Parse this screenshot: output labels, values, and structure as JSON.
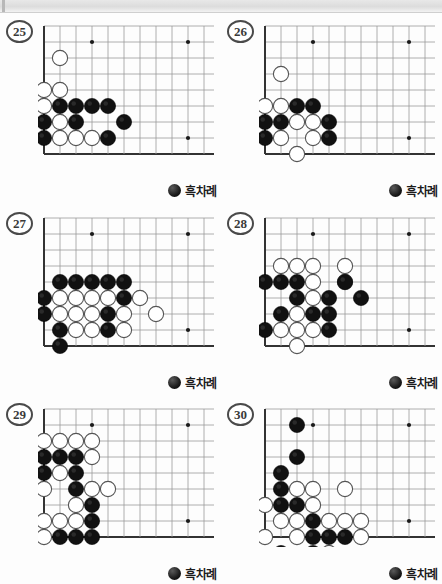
{
  "page": {
    "turn_label": "흑차례",
    "turn_icon": "black-stone-icon",
    "colors": {
      "black_stone": "#111111",
      "white_stone": "#ffffff",
      "line": "#9a9a9a",
      "edge_line": "#333333",
      "star_point": "#1a1a1a",
      "page_background": "#fdfdfd",
      "top_strip": "#e2e2e2"
    },
    "board_geometry": {
      "cols": 11,
      "rows": 9,
      "cell": 16,
      "stone_radius": 7.6,
      "star_points": [
        [
          3,
          1
        ],
        [
          9,
          1
        ],
        [
          9,
          7
        ]
      ],
      "note": "coordinates are [col,row] from left board edge (col 0) and top (row 0); bottom edge is row 8"
    }
  },
  "problems": [
    {
      "number": "25",
      "name": "problem-25",
      "black": [
        [
          1,
          5
        ],
        [
          2,
          5
        ],
        [
          3,
          5
        ],
        [
          4,
          5
        ],
        [
          0,
          6
        ],
        [
          2,
          6
        ],
        [
          5,
          6
        ],
        [
          0,
          7
        ],
        [
          4,
          7
        ]
      ],
      "white": [
        [
          1,
          2
        ],
        [
          1,
          4
        ],
        [
          0,
          4
        ],
        [
          0,
          5
        ],
        [
          1,
          6
        ],
        [
          1,
          7
        ],
        [
          2,
          7
        ],
        [
          3,
          7
        ]
      ]
    },
    {
      "number": "26",
      "name": "problem-26",
      "black": [
        [
          2,
          5
        ],
        [
          3,
          5
        ],
        [
          0,
          6
        ],
        [
          1,
          6
        ],
        [
          4,
          6
        ],
        [
          0,
          7
        ],
        [
          4,
          7
        ]
      ],
      "white": [
        [
          1,
          3
        ],
        [
          0,
          5
        ],
        [
          1,
          5
        ],
        [
          2,
          6
        ],
        [
          3,
          6
        ],
        [
          1,
          7
        ],
        [
          3,
          7
        ],
        [
          2,
          8
        ]
      ]
    },
    {
      "number": "27",
      "name": "problem-27",
      "black": [
        [
          1,
          4
        ],
        [
          2,
          4
        ],
        [
          3,
          4
        ],
        [
          4,
          4
        ],
        [
          5,
          4
        ],
        [
          0,
          5
        ],
        [
          5,
          5
        ],
        [
          0,
          6
        ],
        [
          4,
          6
        ],
        [
          -1,
          7
        ],
        [
          1,
          7
        ],
        [
          4,
          7
        ],
        [
          1,
          8
        ]
      ],
      "white": [
        [
          1,
          5
        ],
        [
          2,
          5
        ],
        [
          3,
          5
        ],
        [
          4,
          5
        ],
        [
          6,
          5
        ],
        [
          1,
          6
        ],
        [
          2,
          6
        ],
        [
          3,
          6
        ],
        [
          5,
          6
        ],
        [
          7,
          6
        ],
        [
          2,
          7
        ],
        [
          3,
          7
        ],
        [
          5,
          7
        ]
      ]
    },
    {
      "number": "28",
      "name": "problem-28",
      "black": [
        [
          0,
          4
        ],
        [
          1,
          4
        ],
        [
          2,
          4
        ],
        [
          2,
          5
        ],
        [
          5,
          4
        ],
        [
          4,
          5
        ],
        [
          6,
          5
        ],
        [
          1,
          6
        ],
        [
          3,
          6
        ],
        [
          4,
          6
        ],
        [
          0,
          7
        ],
        [
          4,
          7
        ]
      ],
      "white": [
        [
          1,
          3
        ],
        [
          2,
          3
        ],
        [
          3,
          3
        ],
        [
          5,
          3
        ],
        [
          3,
          4
        ],
        [
          3,
          5
        ],
        [
          5,
          4
        ],
        [
          2,
          6
        ],
        [
          1,
          7
        ],
        [
          2,
          7
        ],
        [
          3,
          7
        ],
        [
          2,
          8
        ]
      ]
    },
    {
      "number": "29",
      "name": "problem-29",
      "black": [
        [
          0,
          3
        ],
        [
          1,
          3
        ],
        [
          2,
          3
        ],
        [
          0,
          4
        ],
        [
          2,
          4
        ],
        [
          2,
          5
        ],
        [
          3,
          6
        ],
        [
          3,
          7
        ],
        [
          1,
          8
        ],
        [
          2,
          8
        ],
        [
          3,
          8
        ]
      ],
      "white": [
        [
          0,
          2
        ],
        [
          1,
          2
        ],
        [
          2,
          2
        ],
        [
          3,
          2
        ],
        [
          3,
          3
        ],
        [
          1,
          4
        ],
        [
          0,
          5
        ],
        [
          3,
          5
        ],
        [
          4,
          5
        ],
        [
          2,
          6
        ],
        [
          0,
          7
        ],
        [
          1,
          7
        ],
        [
          2,
          7
        ],
        [
          0,
          8
        ]
      ]
    },
    {
      "number": "30",
      "name": "problem-30",
      "black": [
        [
          2,
          1
        ],
        [
          2,
          3
        ],
        [
          1,
          4
        ],
        [
          1,
          5
        ],
        [
          1,
          6
        ],
        [
          2,
          6
        ],
        [
          3,
          7
        ],
        [
          3,
          8
        ],
        [
          4,
          8
        ],
        [
          5,
          8
        ],
        [
          1,
          9
        ],
        [
          3,
          9
        ]
      ],
      "white": [
        [
          2,
          5
        ],
        [
          3,
          5
        ],
        [
          5,
          5
        ],
        [
          0,
          6
        ],
        [
          3,
          6
        ],
        [
          1,
          7
        ],
        [
          2,
          7
        ],
        [
          4,
          7
        ],
        [
          5,
          7
        ],
        [
          6,
          7
        ],
        [
          0,
          8
        ],
        [
          2,
          8
        ],
        [
          6,
          8
        ],
        [
          4,
          9
        ]
      ]
    }
  ]
}
